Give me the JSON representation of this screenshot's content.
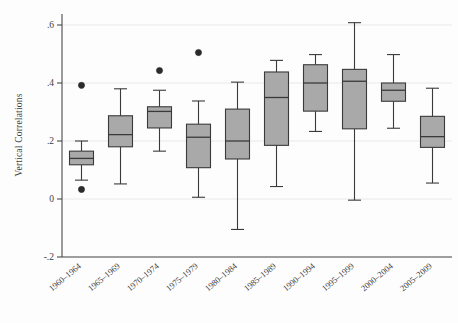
{
  "chart_data": {
    "type": "box",
    "title": "",
    "subtitle": "",
    "xlabel": "",
    "ylabel": "Vertical Correlations",
    "ylim": [
      -0.25,
      0.66
    ],
    "yticks": [
      -0.2,
      0,
      0.2,
      0.4,
      0.6
    ],
    "ytick_labels": [
      "-.2",
      "0",
      ".2",
      ".4",
      ".6"
    ],
    "grid": true,
    "grid_axis": "y",
    "legend": "none",
    "box_fill": "#a9a9a9",
    "box_stroke": "#3a3a3a",
    "outlier_fill": "#2b2b2b",
    "categories": [
      "1960–1964",
      "1965–1969",
      "1970–1974",
      "1975–1979",
      "1980–1984",
      "1985–1989",
      "1990–1994",
      "1995–1999",
      "2000–2004",
      "2005–2009"
    ],
    "boxes": [
      {
        "category": "1960–1964",
        "whisker_low": 0.065,
        "q1": 0.118,
        "median": 0.14,
        "q3": 0.165,
        "whisker_high": 0.2,
        "outliers": [
          0.392,
          0.033
        ]
      },
      {
        "category": "1965–1969",
        "whisker_low": 0.052,
        "q1": 0.18,
        "median": 0.222,
        "q3": 0.287,
        "whisker_high": 0.38,
        "outliers": []
      },
      {
        "category": "1970–1974",
        "whisker_low": 0.165,
        "q1": 0.245,
        "median": 0.302,
        "q3": 0.318,
        "whisker_high": 0.375,
        "outliers": [
          0.443
        ]
      },
      {
        "category": "1975–1979",
        "whisker_low": 0.006,
        "q1": 0.108,
        "median": 0.213,
        "q3": 0.258,
        "whisker_high": 0.338,
        "outliers": [
          0.505
        ]
      },
      {
        "category": "1980–1984",
        "whisker_low": -0.105,
        "q1": 0.138,
        "median": 0.2,
        "q3": 0.31,
        "whisker_high": 0.403,
        "outliers": []
      },
      {
        "category": "1985–1989",
        "whisker_low": 0.043,
        "q1": 0.185,
        "median": 0.35,
        "q3": 0.438,
        "whisker_high": 0.478,
        "outliers": []
      },
      {
        "category": "1990–1994",
        "whisker_low": 0.233,
        "q1": 0.303,
        "median": 0.4,
        "q3": 0.463,
        "whisker_high": 0.498,
        "outliers": []
      },
      {
        "category": "1995–1999",
        "whisker_low": -0.004,
        "q1": 0.242,
        "median": 0.406,
        "q3": 0.447,
        "whisker_high": 0.608,
        "outliers": []
      },
      {
        "category": "2000–2004",
        "whisker_low": 0.244,
        "q1": 0.337,
        "median": 0.375,
        "q3": 0.4,
        "whisker_high": 0.498,
        "outliers": []
      },
      {
        "category": "2005–2009",
        "whisker_low": 0.055,
        "q1": 0.178,
        "median": 0.215,
        "q3": 0.285,
        "whisker_high": 0.382,
        "outliers": []
      }
    ]
  },
  "axes": {
    "y_title": "Vertical Correlations"
  }
}
